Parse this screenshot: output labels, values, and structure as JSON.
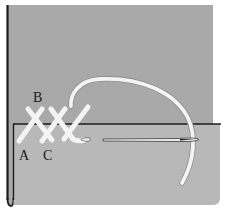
{
  "diagram": {
    "labels": {
      "a": "A",
      "b": "B",
      "c": "C"
    },
    "colors": {
      "background": "#ffffff",
      "back_fabric": "#a9a9a9",
      "front_fabric": "#b7b7b7",
      "edge": "#1c1c1c",
      "thread": "#f4f4f4",
      "needle": "#f0f0f0"
    },
    "elements": [
      "back-fabric-panel",
      "folded-hem-panel",
      "cross-stitches",
      "thread-arc",
      "needle"
    ]
  }
}
